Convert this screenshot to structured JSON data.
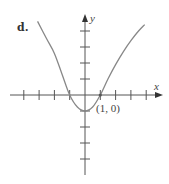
{
  "panel_label": "d.",
  "chart_data": {
    "type": "line",
    "title": "",
    "xlabel": "x",
    "ylabel": "y",
    "xlim": [
      -4,
      4
    ],
    "ylim": [
      -4,
      4
    ],
    "grid": false,
    "x_ticks": [
      -4,
      -3,
      -2,
      -1,
      1,
      2,
      3,
      4
    ],
    "y_ticks": [
      -4,
      -3,
      -2,
      -1,
      1,
      2,
      3,
      4
    ],
    "series": [
      {
        "name": "curve",
        "x": [
          -3.1,
          -2.5,
          -2,
          -1.5,
          -1,
          -0.5,
          0,
          0.5,
          1,
          1.5,
          2,
          2.5,
          3,
          3.5,
          3.9
        ],
        "y": [
          4.6,
          3.5,
          2.6,
          1.3,
          0,
          -0.75,
          -1,
          -0.75,
          0,
          1.0,
          1.9,
          2.7,
          3.4,
          4.0,
          4.4
        ]
      }
    ],
    "annotations": [
      {
        "text": "(1, 0)",
        "x": 1,
        "y": 0
      }
    ],
    "color": "#888888"
  }
}
